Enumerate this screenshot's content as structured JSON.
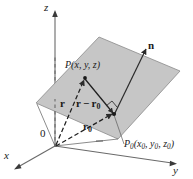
{
  "figure": {
    "background_color": "#ffffff",
    "plane_fill_color": "#c6c6c6",
    "plane_stroke_color": "#7a7a7a",
    "line_color": "#2b2b2b",
    "axis_color": "#555555",
    "text_color": "#1a1a1a"
  },
  "axes": {
    "x_label": "x",
    "y_label": "y",
    "z_label": "z",
    "origin_label": "0"
  },
  "points": {
    "p_label": "P(x, y, z)",
    "p_label_prefix": "P",
    "p_label_coords": "(x, y, z)",
    "p0_label_prefix": "P",
    "p0_label_subscript": "0",
    "p0_label_coords": "(x0, y0, z0)"
  },
  "vectors": {
    "r_label": "r",
    "r0_label_base": "r",
    "r0_label_subscript": "0",
    "r_minus_r0_base": "r",
    "r_minus_r0_minus": "−",
    "r_minus_r0_tail": "r",
    "r_minus_r0_subscript": "0",
    "normal_label": "n"
  },
  "annotations": {
    "right_angle_marker": "right-angle"
  }
}
